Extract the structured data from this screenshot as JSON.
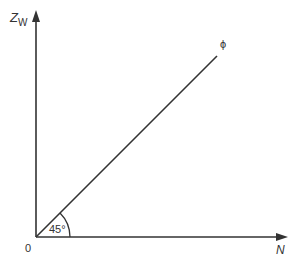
{
  "diagram": {
    "y_axis_label_main": "Z",
    "y_axis_label_sub": "W",
    "x_axis_label": "N",
    "origin_label": "0",
    "line_label": "ϕ",
    "angle_label": "45°",
    "angle_degrees": 45,
    "colors": {
      "stroke": "#333333",
      "text": "#333333",
      "background": "#ffffff"
    }
  }
}
